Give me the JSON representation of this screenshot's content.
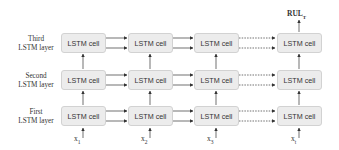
{
  "diagram": {
    "layers": [
      {
        "label_line1": "Third",
        "label_line2": "LSTM layer"
      },
      {
        "label_line1": "Second",
        "label_line2": "LSTM layer"
      },
      {
        "label_line1": "First",
        "label_line2": "LSTM layer"
      }
    ],
    "cell_label": "LSTM cell",
    "inputs": [
      {
        "base": "x",
        "sub": "1"
      },
      {
        "base": "x",
        "sub": "2"
      },
      {
        "base": "x",
        "sub": "3"
      },
      {
        "base": "x",
        "sub": "t"
      }
    ],
    "output": {
      "base": "RUL",
      "sub": "T"
    },
    "colors": {
      "cell_fill": "#ececec",
      "cell_border": "#d2d2d2",
      "arrow": "#333333"
    }
  }
}
